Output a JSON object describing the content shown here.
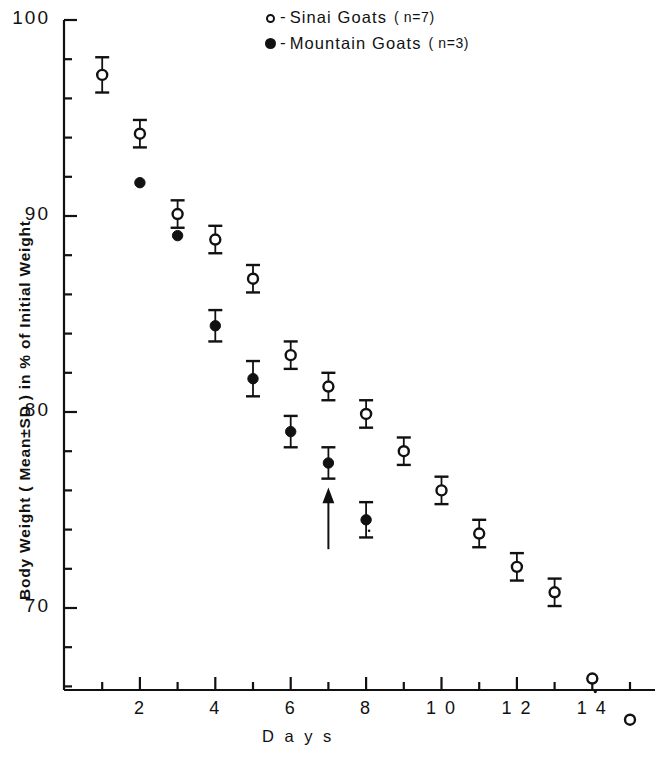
{
  "chart_data": {
    "type": "scatter",
    "title": "",
    "xlabel": "Days",
    "ylabel": "Body Weight ( Mean ± SD ) in % of Initial Weight",
    "xlim": [
      0,
      15.6
    ],
    "ylim": [
      64.0,
      100.0
    ],
    "grid": false,
    "legend_position": "top-center-right",
    "x_ticks_major": [
      2,
      4,
      6,
      8,
      10,
      12,
      14
    ],
    "x_ticks_minor": [
      1,
      3,
      5,
      7,
      9,
      11,
      13,
      15
    ],
    "y_ticks_major": [
      70,
      80,
      90,
      100
    ],
    "y_ticks_minor": [
      66,
      68,
      72,
      74,
      76,
      78,
      82,
      84,
      86,
      88,
      92,
      94,
      96,
      98
    ],
    "series": [
      {
        "name": "Sinai Goats",
        "marker": "open-circle",
        "n": 7,
        "legend_label": "Sinai Goats",
        "legend_n": "( n=7)",
        "points": [
          {
            "x": 1,
            "y": 97.2,
            "sd": 0.9
          },
          {
            "x": 2,
            "y": 94.2,
            "sd": 0.7
          },
          {
            "x": 3,
            "y": 90.1,
            "sd": 0.7
          },
          {
            "x": 4,
            "y": 88.8,
            "sd": 0.7
          },
          {
            "x": 5,
            "y": 86.8,
            "sd": 0.7
          },
          {
            "x": 6,
            "y": 82.9,
            "sd": 0.7
          },
          {
            "x": 7,
            "y": 81.3,
            "sd": 0.7
          },
          {
            "x": 8,
            "y": 79.9,
            "sd": 0.7
          },
          {
            "x": 9,
            "y": 78.0,
            "sd": 0.7
          },
          {
            "x": 10,
            "y": 76.0,
            "sd": 0.7
          },
          {
            "x": 11,
            "y": 73.8,
            "sd": 0.7
          },
          {
            "x": 12,
            "y": 72.1,
            "sd": 0.7
          },
          {
            "x": 13,
            "y": 70.8,
            "sd": 0.7
          },
          {
            "x": 14,
            "y": 66.4,
            "sd": 0.0
          },
          {
            "x": 15,
            "y": 64.3,
            "sd": 0.0
          }
        ]
      },
      {
        "name": "Mountain Goats",
        "marker": "filled-circle",
        "n": 3,
        "legend_label": "Mountain Goats",
        "legend_n": "( n=3)",
        "points": [
          {
            "x": 2,
            "y": 91.7,
            "sd": 0.0
          },
          {
            "x": 3,
            "y": 89.0,
            "sd": 0.0
          },
          {
            "x": 4,
            "y": 84.4,
            "sd": 0.8
          },
          {
            "x": 5,
            "y": 81.7,
            "sd": 0.9
          },
          {
            "x": 6,
            "y": 79.0,
            "sd": 0.8
          },
          {
            "x": 7,
            "y": 77.4,
            "sd": 0.8
          },
          {
            "x": 8,
            "y": 74.5,
            "sd": 0.9
          }
        ]
      }
    ],
    "annotations": [
      {
        "type": "arrow",
        "direction": "up",
        "x": 7,
        "y_from": 73.0,
        "y_to": 75.8,
        "label": ""
      }
    ]
  },
  "legend": {
    "rows": [
      {
        "marker": "open-circle",
        "dash": "-",
        "label": "Sinai  Goats",
        "n": "( n=7)"
      },
      {
        "marker": "filled-circle",
        "dash": "-",
        "label": "Mountain  Goats",
        "n": "( n=3)"
      }
    ]
  },
  "axes": {
    "y_label": "Body Weight ( Mean±SD ) in % of Initial Weight",
    "x_label": "D a y s",
    "y_tick_labels": [
      "100",
      "90",
      "80",
      "70"
    ],
    "x_tick_labels": [
      "2",
      "4",
      "6",
      "8",
      "1 0",
      "1 2",
      "1 4"
    ]
  }
}
